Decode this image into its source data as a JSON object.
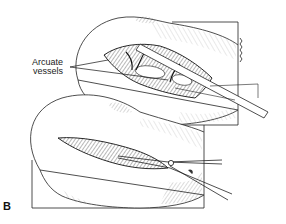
{
  "figure": {
    "panel_label": "B",
    "annotations": [
      {
        "text_line1": "Arcuate",
        "text_line2": "vessels",
        "target": "arcuate vessels in upper kidney incision"
      }
    ],
    "views": [
      {
        "name": "upper-view",
        "description": "kidney with opened incision exposing arcuate vessels, instrument inserted"
      },
      {
        "name": "lower-view",
        "description": "kidney incision being extended with scissors"
      }
    ],
    "colors": {
      "ink": "#1a1a1a",
      "paper": "#ffffff",
      "hatch": "#555555"
    }
  }
}
